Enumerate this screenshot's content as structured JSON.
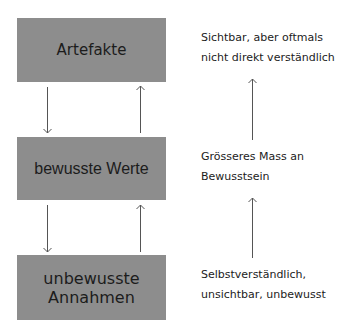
{
  "diagram": {
    "levels": [
      {
        "name": "Artefakte",
        "lines": [
          "Artefakte"
        ],
        "description": [
          "Sichtbar, aber oftmals",
          "nicht direkt verständlich"
        ]
      },
      {
        "name": "bewusste Werte",
        "lines": [
          "bewusste Werte"
        ],
        "description": [
          "Grösseres Mass an",
          "Bewusstsein"
        ]
      },
      {
        "name": "unbewusste Annahmen",
        "lines": [
          "unbewusste",
          "Annahmen"
        ],
        "description": [
          "Selbstverständlich,",
          "unsichtbar, unbewusst"
        ]
      }
    ],
    "colors": {
      "box_fill": "#8d8d8d",
      "text": "#1c1c1c",
      "arrow": "#555555"
    },
    "arrows": [
      {
        "from": "Artefakte",
        "to": "bewusste Werte",
        "direction": "down"
      },
      {
        "from": "bewusste Werte",
        "to": "Artefakte",
        "direction": "up"
      },
      {
        "from": "bewusste Werte",
        "to": "unbewusste Annahmen",
        "direction": "down"
      },
      {
        "from": "unbewusste Annahmen",
        "to": "bewusste Werte",
        "direction": "up"
      },
      {
        "side": "right",
        "between": [
          "Grösseres Mass an Bewusstsein",
          "Sichtbar, aber oftmals nicht direkt verständlich"
        ],
        "direction": "up"
      },
      {
        "side": "right",
        "between": [
          "Selbstverständlich, unsichtbar, unbewusst",
          "Grösseres Mass an Bewusstsein"
        ],
        "direction": "up"
      }
    ]
  }
}
